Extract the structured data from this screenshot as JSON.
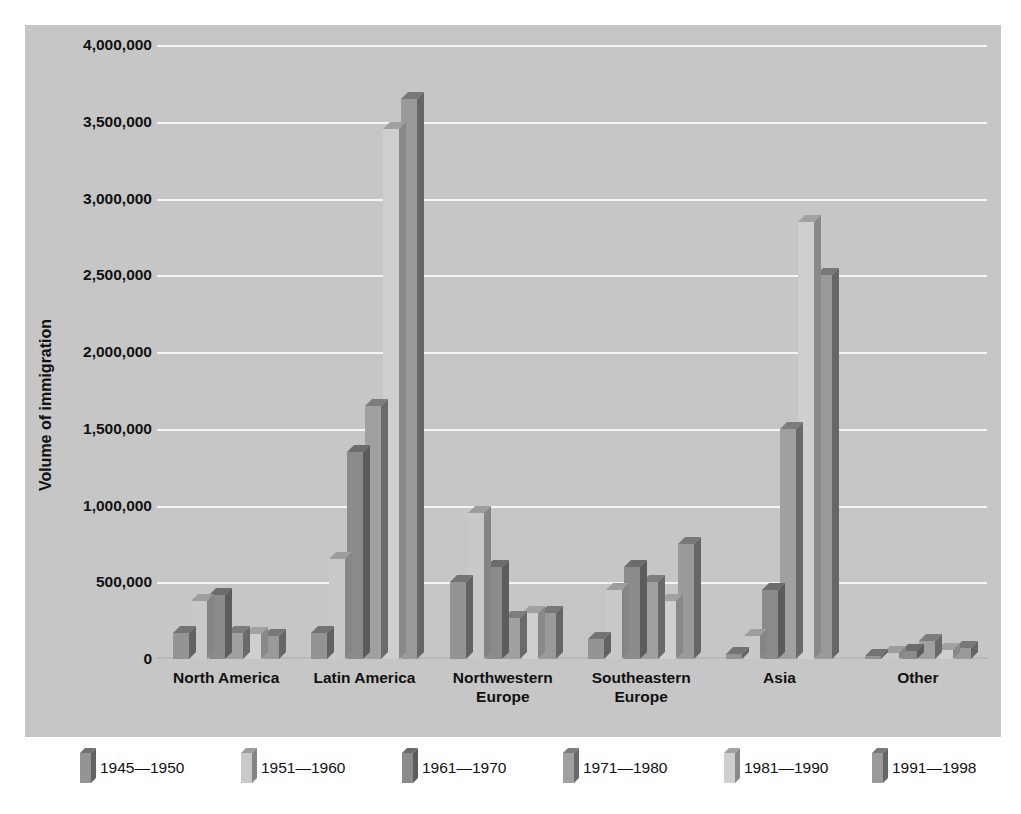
{
  "chart_data": {
    "type": "bar",
    "title": "",
    "subtitle": "",
    "xlabel": "",
    "ylabel": "Volume of immigration",
    "ylim": [
      0,
      4000000
    ],
    "grid": true,
    "legend_position": "bottom",
    "y_ticks": [
      "0",
      "500,000",
      "1,000,000",
      "1,500,000",
      "2,000,000",
      "2,500,000",
      "3,000,000",
      "3,500,000",
      "4,000,000"
    ],
    "y_tick_values": [
      0,
      500000,
      1000000,
      1500000,
      2000000,
      2500000,
      3000000,
      3500000,
      4000000
    ],
    "categories": [
      "North America",
      "Latin America",
      "Northwestern Europe",
      "Southeastern Europe",
      "Asia",
      "Other"
    ],
    "series": [
      {
        "name": "1945—1950",
        "color": "#949494",
        "values": [
          170000,
          170000,
          500000,
          130000,
          35000,
          20000
        ]
      },
      {
        "name": "1951—1960",
        "color": "#c9c9c9",
        "values": [
          380000,
          650000,
          950000,
          450000,
          150000,
          40000
        ]
      },
      {
        "name": "1961—1970",
        "color": "#8b8b8b",
        "values": [
          420000,
          1350000,
          600000,
          600000,
          450000,
          50000
        ]
      },
      {
        "name": "1971—1980",
        "color": "#a0a0a0",
        "values": [
          170000,
          1650000,
          270000,
          500000,
          1500000,
          120000
        ]
      },
      {
        "name": "1981—1990",
        "color": "#cfcfcf",
        "values": [
          160000,
          3450000,
          300000,
          380000,
          2850000,
          60000
        ]
      },
      {
        "name": "1991—1998",
        "color": "#9a9a9a",
        "values": [
          150000,
          3650000,
          300000,
          750000,
          2500000,
          70000
        ]
      }
    ]
  },
  "legend": {
    "items": [
      {
        "label": "1945—1950"
      },
      {
        "label": "1951—1960"
      },
      {
        "label": "1961—1970"
      },
      {
        "label": "1971—1980"
      },
      {
        "label": "1981—1990"
      },
      {
        "label": "1991—1998"
      }
    ]
  },
  "colors": {
    "panel_background": "#c6c6c6",
    "page_background": "#ffffff",
    "gridline": "#f4f4f4",
    "text": "#111111"
  }
}
